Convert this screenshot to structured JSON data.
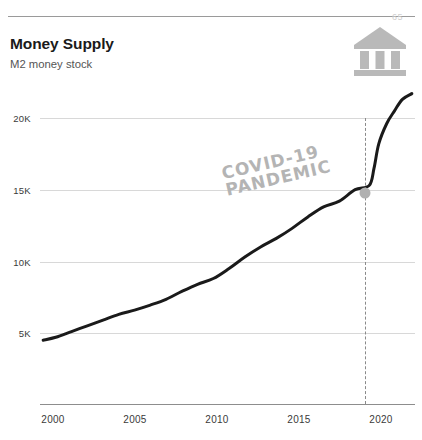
{
  "page": {
    "number": "65",
    "title": "Money Supply",
    "subtitle": "M2 money stock",
    "icon": "bank-icon"
  },
  "chart_data": {
    "type": "line",
    "title": "Money Supply",
    "subtitle": "M2 money stock",
    "xlabel": "",
    "ylabel": "",
    "xlim": [
      1999,
      2022.8
    ],
    "ylim": [
      3000,
      22500
    ],
    "grid": true,
    "legend": null,
    "y_ticks": [
      "5K",
      "10K",
      "15K",
      "20K"
    ],
    "y_tick_values": [
      5000,
      10000,
      15000,
      20000
    ],
    "x_ticks": [
      "2000",
      "2005",
      "2010",
      "2015",
      "2020"
    ],
    "x_tick_values": [
      2000,
      2005,
      2010,
      2015,
      2020
    ],
    "series": [
      {
        "name": "M2 money stock",
        "color": "#1a1a1a",
        "x": [
          1999.2,
          2000,
          2001,
          2002,
          2003,
          2004,
          2005,
          2006,
          2007,
          2008,
          2009,
          2010,
          2011,
          2012,
          2013,
          2014,
          2015,
          2016,
          2017,
          2018,
          2019,
          2019.9,
          2020.2,
          2020.5,
          2021,
          2021.5,
          2022,
          2022.6
        ],
        "values": [
          4500,
          4700,
          5100,
          5500,
          5900,
          6300,
          6600,
          6950,
          7350,
          7900,
          8400,
          8800,
          9500,
          10300,
          11000,
          11600,
          12300,
          13100,
          13800,
          14200,
          15000,
          15300,
          16500,
          18200,
          19600,
          20500,
          21300,
          21700
        ]
      }
    ],
    "annotations": [
      {
        "text_lines": [
          "COVID-19",
          "PANDEMIC"
        ],
        "at_x": 2019.9,
        "at_y": 15300,
        "marker": "circle",
        "marker_color": "#b0b0b0",
        "vline": true,
        "vline_style": "dashed",
        "vline_color": "#8a8a8a",
        "text_color": "#b4b4b4",
        "rotation_deg": -13
      }
    ]
  }
}
